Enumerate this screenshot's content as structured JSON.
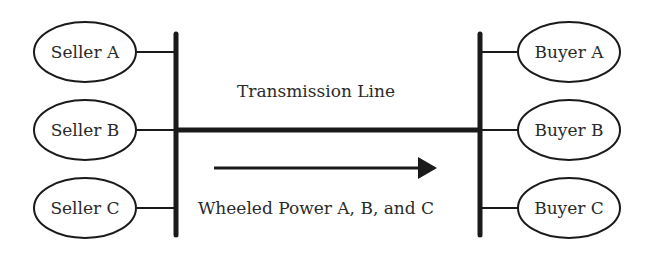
{
  "diagram": {
    "line_label": "Transmission Line",
    "flow_label": "Wheeled Power A, B, and C",
    "sellers": [
      {
        "label": "Seller A"
      },
      {
        "label": "Seller B"
      },
      {
        "label": "Seller C"
      }
    ],
    "buyers": [
      {
        "label": "Buyer A"
      },
      {
        "label": "Buyer B"
      },
      {
        "label": "Buyer C"
      }
    ],
    "colors": {
      "stroke": "#1a1a1a",
      "text": "#2a2a2a",
      "background": "#ffffff"
    }
  }
}
